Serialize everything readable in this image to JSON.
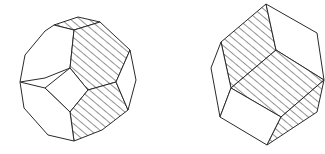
{
  "figures": [
    {
      "id": "left",
      "label": "truncated-octahedron",
      "stroke_color": "#2a2a2a",
      "background": "#ffffff",
      "faces": [
        {
          "name": "top-strip",
          "fill": "hatch",
          "points": "54,25 78,17 100,22 74,30"
        },
        {
          "name": "upper-left-hexagon",
          "fill": "white",
          "points": "54,25 74,30 70,68 45,78 20,82 25,55 45,31"
        },
        {
          "name": "right-hexagon",
          "fill": "hatch",
          "points": "74,30 100,22 130,50 116,82 88,90 70,68"
        },
        {
          "name": "center-square",
          "fill": "white",
          "points": "70,68 88,90 70,112 45,88"
        },
        {
          "name": "lower-hexagon",
          "fill": "hatch",
          "points": "88,90 116,82 128,110 102,130 74,141 70,112"
        },
        {
          "name": "lower-left-hexagon",
          "fill": "white",
          "points": "20,82 45,88 70,112 74,141 48,135 24,108"
        },
        {
          "name": "right-edge-face",
          "fill": "white",
          "points": "130,50 136,80 128,110 116,82"
        }
      ]
    },
    {
      "id": "right",
      "label": "rhombic-dodecahedron",
      "stroke_color": "#2a2a2a",
      "background": "#ffffff",
      "faces": [
        {
          "name": "upper-left-rhombus",
          "fill": "hatch",
          "points": "266,4 276,50 231,88 221,42"
        },
        {
          "name": "upper-right-rhombus",
          "fill": "white",
          "points": "266,4 317,33 324,80 276,50"
        },
        {
          "name": "left-rhombus",
          "fill": "white",
          "points": "221,42 231,88 220,117 211,68"
        },
        {
          "name": "center-rhombus",
          "fill": "hatch",
          "points": "276,50 324,80 281,117 231,88"
        },
        {
          "name": "lower-left-rhombus",
          "fill": "white",
          "points": "231,88 281,117 267,145 220,117"
        },
        {
          "name": "lower-right-rhombus",
          "fill": "hatch",
          "points": "281,117 324,80 317,112 267,145"
        }
      ]
    }
  ]
}
